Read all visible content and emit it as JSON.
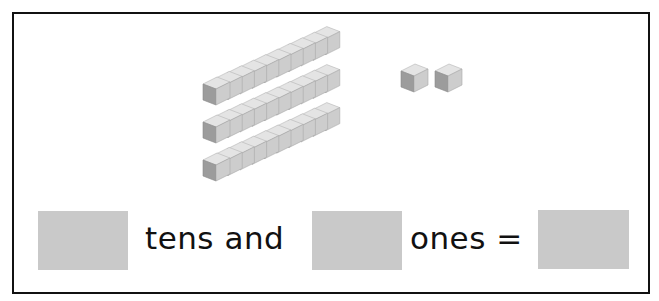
{
  "worksheet": {
    "equation": {
      "tens_label": "tens and",
      "ones_label": "ones =",
      "tens_answer": "",
      "ones_answer": "",
      "total_answer": ""
    },
    "base_ten_blocks": {
      "tens_rods": 3,
      "cubes_per_rod": 10,
      "unit_cubes": 2
    },
    "colors": {
      "answer_box": "#c9c9c9",
      "frame": "#111111",
      "cube_top": "#e6e6e6",
      "cube_front": "#9a9a9a",
      "cube_side": "#cfcfcf"
    }
  }
}
